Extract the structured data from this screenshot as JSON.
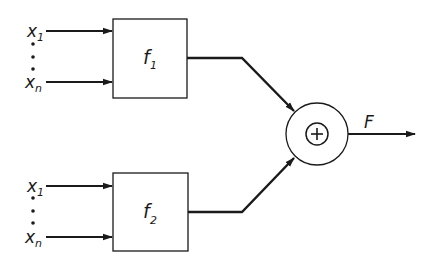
{
  "diagram": {
    "type": "block-diagram",
    "colors": {
      "stroke": "#1a1a1a",
      "background": "#ffffff"
    },
    "blocks": [
      {
        "id": "f1",
        "label": "f",
        "subscript": "1",
        "inputs": [
          {
            "label": "x",
            "subscript": "1"
          },
          {
            "label": "x",
            "subscript": "n"
          }
        ]
      },
      {
        "id": "f2",
        "label": "f",
        "subscript": "2",
        "inputs": [
          {
            "label": "x",
            "subscript": "1"
          },
          {
            "label": "x",
            "subscript": "n"
          }
        ]
      }
    ],
    "summer": {
      "symbol": "+"
    },
    "output": {
      "label": "F"
    }
  }
}
